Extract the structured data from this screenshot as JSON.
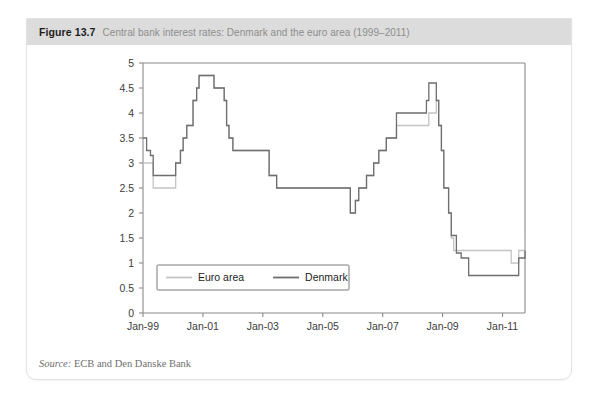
{
  "figure": {
    "number": "Figure 13.7",
    "title": "Central bank interest rates: Denmark and the euro area (1999–2011)",
    "source_label": "Source:",
    "source_text": " ECB and Den Danske Bank"
  },
  "colors": {
    "header_band": "#dcdcdc",
    "figure_border": "#e3e3e3",
    "denmark_line": "#6e6e6e",
    "euro_line": "#c4c4c4",
    "axis": "#8a8a8a",
    "tick_label": "#3c3c3c",
    "title_gray": "#8d8d8d",
    "fig_num_dark": "#1d1d1d"
  },
  "chart_data": {
    "type": "line",
    "title": "Central bank interest rates: Denmark and the euro area (1999–2011)",
    "xlabel": "",
    "ylabel": "",
    "ylim": [
      0,
      5
    ],
    "ytick_labels": [
      "0",
      "0.5",
      "1",
      "1.5",
      "2",
      "2.5",
      "3",
      "3.5",
      "4",
      "4.5",
      "5"
    ],
    "ytick_values": [
      0,
      0.5,
      1,
      1.5,
      2,
      2.5,
      3,
      3.5,
      4,
      4.5,
      5
    ],
    "xtick_labels": [
      "Jan-99",
      "Jan-01",
      "Jan-03",
      "Jan-05",
      "Jan-07",
      "Jan-09",
      "Jan-11"
    ],
    "xtick_values": [
      1999.0,
      2001.0,
      2003.0,
      2005.0,
      2007.0,
      2009.0,
      2011.0
    ],
    "xlim": [
      1999.0,
      2011.75
    ],
    "grid": false,
    "legend_position": "bottom-left-inside",
    "step_style": "post",
    "series": [
      {
        "name": "Euro area",
        "color": "#c4c4c4",
        "x": [
          1999.0,
          1999.25,
          1999.34,
          1999.92,
          2000.09,
          2000.25,
          2000.34,
          2000.46,
          2000.67,
          2000.79,
          2000.87,
          2001.37,
          2001.71,
          2001.79,
          2001.87,
          2002.0,
          2002.96,
          2003.21,
          2003.46,
          2005.92,
          2006.09,
          2006.2,
          2006.46,
          2006.7,
          2006.87,
          2007.12,
          2007.46,
          2008.54,
          2008.79,
          2008.87,
          2008.96,
          2009.04,
          2009.2,
          2009.29,
          2009.37,
          2011.29,
          2011.54,
          2011.75
        ],
        "y": [
          3.0,
          3.0,
          2.5,
          2.5,
          3.0,
          3.25,
          3.5,
          3.75,
          4.25,
          4.5,
          4.75,
          4.5,
          4.25,
          3.75,
          3.5,
          3.25,
          3.25,
          2.75,
          2.5,
          2.0,
          2.25,
          2.5,
          2.75,
          3.0,
          3.25,
          3.5,
          3.75,
          4.0,
          4.25,
          3.75,
          3.25,
          2.5,
          2.0,
          1.5,
          1.25,
          1.0,
          1.25,
          1.5
        ],
        "y_final_note": "ECB main refi: 3.0 at Jan-99, cut to 2.5 Apr-99, peak 4.75 Oct-00, floor 1.0 May-09, raised to 1.25 Apr-11 and 1.5 Jul-11"
      },
      {
        "name": "Denmark",
        "color": "#6e6e6e",
        "x": [
          1999.0,
          1999.12,
          1999.25,
          1999.34,
          1999.92,
          2000.09,
          2000.25,
          2000.34,
          2000.46,
          2000.67,
          2000.79,
          2000.87,
          2001.37,
          2001.71,
          2001.79,
          2001.87,
          2002.0,
          2002.96,
          2003.21,
          2003.46,
          2005.92,
          2006.09,
          2006.2,
          2006.46,
          2006.7,
          2006.87,
          2007.12,
          2007.46,
          2008.46,
          2008.54,
          2008.79,
          2008.87,
          2008.96,
          2009.04,
          2009.2,
          2009.29,
          2009.46,
          2009.62,
          2009.87,
          2011.29,
          2011.54,
          2011.75
        ],
        "y": [
          3.5,
          3.25,
          3.15,
          2.75,
          2.75,
          3.0,
          3.25,
          3.5,
          3.75,
          4.25,
          4.5,
          4.75,
          4.5,
          4.25,
          3.75,
          3.5,
          3.25,
          3.25,
          2.75,
          2.5,
          2.0,
          2.25,
          2.5,
          2.75,
          3.0,
          3.25,
          3.5,
          4.0,
          4.25,
          4.6,
          4.25,
          3.75,
          3.25,
          2.5,
          2.0,
          1.55,
          1.2,
          1.1,
          0.75,
          0.75,
          1.1,
          1.25
        ],
        "y_final_note": "Danish lending rate: 3.5 Jan-99, trough 0.75 in 2010, raised to ~1.25 by late 2011"
      }
    ],
    "legend": [
      {
        "label": "Euro area",
        "color": "#c4c4c4"
      },
      {
        "label": "Denmark",
        "color": "#6e6e6e"
      }
    ]
  }
}
